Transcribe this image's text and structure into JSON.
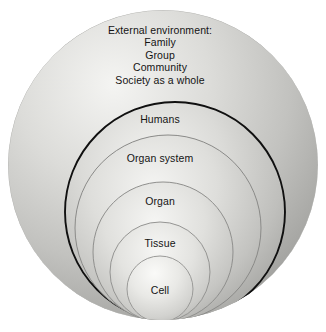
{
  "figure": {
    "type": "nested-spheres-diagram",
    "background_color": "#ffffff",
    "text_color": "#141414",
    "sphere_light_color": "#f2f2f0",
    "sphere_mid_color": "#c9c9c6",
    "sphere_dark_color": "#8c8c8a",
    "outline_highlight_color": "#101010"
  },
  "levels": [
    {
      "id": "external-environment",
      "label_lines": [
        "External environment:",
        "Family",
        "Group",
        "Community",
        "Society as a whole"
      ],
      "label_x": 160,
      "label_y": 24,
      "cx": 163,
      "cy": 165,
      "r": 155,
      "outlined": false
    },
    {
      "id": "humans",
      "label_lines": [
        "Humans"
      ],
      "label_x": 160,
      "label_y": 113,
      "cx": 175,
      "cy": 212,
      "r": 110,
      "outlined": true
    },
    {
      "id": "organ-system",
      "label_lines": [
        "Organ system"
      ],
      "label_x": 160,
      "label_y": 152,
      "cx": 168,
      "cy": 228,
      "r": 93,
      "outlined": false
    },
    {
      "id": "organ",
      "label_lines": [
        "Organ"
      ],
      "label_x": 160,
      "label_y": 195,
      "cx": 163,
      "cy": 252,
      "r": 70,
      "outlined": false
    },
    {
      "id": "tissue",
      "label_lines": [
        "Tissue"
      ],
      "label_x": 160,
      "label_y": 237,
      "cx": 160,
      "cy": 272,
      "r": 50,
      "outlined": false
    },
    {
      "id": "cell",
      "label_lines": [
        "Cell"
      ],
      "label_x": 160,
      "label_y": 284,
      "cx": 160,
      "cy": 289,
      "r": 33,
      "outlined": false
    }
  ]
}
